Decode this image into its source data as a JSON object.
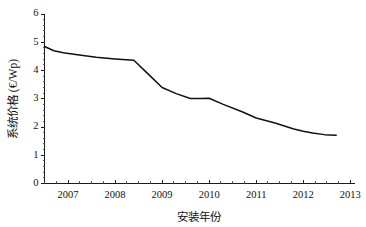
{
  "chart_data": {
    "type": "line",
    "title": "",
    "xlabel": "安装年份",
    "ylabel": "系统价格 (€/Wp)",
    "xlim": [
      2006.5,
      2013.1
    ],
    "ylim": [
      0,
      6
    ],
    "grid": false,
    "legend": null,
    "x_ticks": [
      2007,
      2008,
      2009,
      2010,
      2011,
      2012,
      2013
    ],
    "x_tick_labels": [
      "2007",
      "2008",
      "2009",
      "2010",
      "2011",
      "2012",
      "2013"
    ],
    "x_minor_interval": 0.25,
    "y_ticks": [
      0,
      1,
      2,
      3,
      4,
      5,
      6
    ],
    "y_tick_labels": [
      "0",
      "1",
      "2",
      "3",
      "4",
      "5",
      "6"
    ],
    "y_minor_interval": 0.2,
    "series": [
      {
        "name": "系统价格",
        "color": "#111111",
        "x": [
          2006.5,
          2006.7,
          2006.9,
          2007.2,
          2007.6,
          2008.0,
          2008.4,
          2008.7,
          2009.0,
          2009.3,
          2009.6,
          2009.8,
          2010.0,
          2010.3,
          2010.7,
          2011.0,
          2011.4,
          2011.8,
          2012.0,
          2012.2,
          2012.45,
          2012.7
        ],
        "y": [
          4.85,
          4.7,
          4.63,
          4.56,
          4.47,
          4.41,
          4.36,
          3.88,
          3.4,
          3.18,
          3.01,
          3.01,
          3.02,
          2.8,
          2.54,
          2.32,
          2.14,
          1.93,
          1.85,
          1.79,
          1.73,
          1.71
        ]
      }
    ]
  }
}
